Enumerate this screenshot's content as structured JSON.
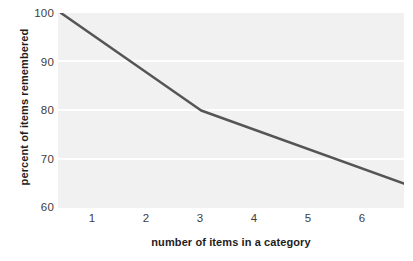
{
  "chart_data": {
    "type": "line",
    "title": "",
    "xlabel": "number of items in a category",
    "ylabel": "percent of items remembered",
    "xlim": [
      0.6,
      6.4
    ],
    "ylim": [
      60,
      100
    ],
    "xticks": [
      1,
      2,
      3,
      4,
      5,
      6
    ],
    "xticklabels": [
      "1",
      "2",
      "3",
      "4",
      "5",
      "6"
    ],
    "yticks": [
      60,
      70,
      80,
      90,
      100
    ],
    "yticklabels": [
      "60",
      "70",
      "80",
      "90",
      "100"
    ],
    "grid": "horizontal-white-gridlines",
    "gridline_values": [
      70,
      80,
      90
    ],
    "legend": "none",
    "plot_background": "#f1f1f1",
    "line_color": "#555555",
    "line_width": 2.5,
    "x": [
      0.65,
      3.0,
      6.4
    ],
    "y": [
      100,
      80,
      65
    ],
    "series": [
      {
        "name": "percent remembered",
        "points": [
          {
            "x": 0.65,
            "y": 100
          },
          {
            "x": 3.0,
            "y": 80
          },
          {
            "x": 6.4,
            "y": 65
          }
        ]
      }
    ]
  },
  "axes": {
    "x_title": "number of items in a category",
    "y_title": "percent of items remembered"
  }
}
